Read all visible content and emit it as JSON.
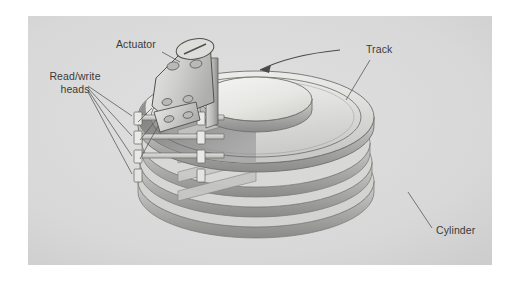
{
  "figure": {
    "type": "technical-illustration",
    "panel_background": "#d9d9d9",
    "page_background": "#ffffff",
    "text_color": "#3a3a3a"
  },
  "labels": {
    "actuator": "Actuator",
    "read_write_heads": "Read/write\nheads",
    "track": "Track",
    "cylinder": "Cylinder"
  },
  "components": {
    "platter_count": 4,
    "head_arm_count": 4,
    "rotation_arrow": "counter-clockwise-arrow",
    "top_platter_face": "#f0f0ef",
    "platter_edge": "#8e8e8e",
    "platter_shadow": "#9a9a9a",
    "actuator_body": "#cfcfcf",
    "actuator_outline": "#5a5a5a"
  }
}
